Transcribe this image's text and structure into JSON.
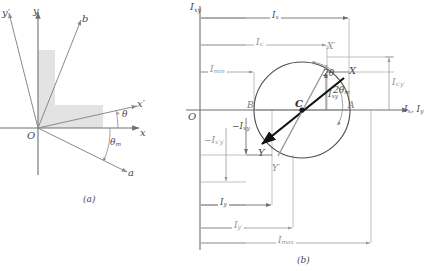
{
  "figure": {
    "panel_a": {
      "caption": "(a)",
      "axes": [
        {
          "name": "y-axis",
          "label": "y"
        },
        {
          "name": "x-axis",
          "label": "x"
        },
        {
          "name": "y-prime-axis",
          "label": "y′"
        },
        {
          "name": "x-prime-axis",
          "label": "x′"
        },
        {
          "name": "a-axis",
          "label": "a"
        },
        {
          "name": "b-axis",
          "label": "b"
        }
      ],
      "origin_label": "O",
      "angles": [
        {
          "name": "theta",
          "label": "θ"
        },
        {
          "name": "theta-m",
          "label": "θ",
          "sub": "m"
        }
      ],
      "shape": "L-shaped-section"
    },
    "panel_b": {
      "caption": "(b)",
      "origin_label": "O",
      "axis_vertical_label": "I",
      "axis_vertical_sub": "xy",
      "axis_horizontal_label": "I",
      "axis_horizontal_sub": "x",
      "axis_horizontal_label2": ", I",
      "axis_horizontal_sub2": "y",
      "points": [
        {
          "name": "point-X",
          "label": "X"
        },
        {
          "name": "point-X-prime",
          "label": "X′"
        },
        {
          "name": "point-Y",
          "label": "Y"
        },
        {
          "name": "point-Y-prime",
          "label": "Y′"
        },
        {
          "name": "point-A",
          "label": "A"
        },
        {
          "name": "point-B",
          "label": "B"
        },
        {
          "name": "point-C",
          "label": "C"
        }
      ],
      "angles": [
        {
          "name": "two-theta",
          "label": "2θ"
        },
        {
          "name": "two-theta-m",
          "label": "2θ",
          "sub": "m"
        }
      ],
      "dimensions": [
        {
          "name": "dim-Ix",
          "label": "I",
          "sub": "x"
        },
        {
          "name": "dim-Ix-prime",
          "label": "I",
          "sub": "x′"
        },
        {
          "name": "dim-Imin",
          "label": "I",
          "sub": "min"
        },
        {
          "name": "dim-Iy",
          "label": "I",
          "sub": "y"
        },
        {
          "name": "dim-Iy-prime",
          "label": "I",
          "sub": "y′"
        },
        {
          "name": "dim-Imax",
          "label": "I",
          "sub": "max"
        },
        {
          "name": "dim-Ixy",
          "label": "I",
          "sub": "xy"
        },
        {
          "name": "dim-Ixy-neg",
          "label": "−I",
          "sub": "xy"
        },
        {
          "name": "dim-Ixpyp",
          "label": "I",
          "sub": "x′y′"
        },
        {
          "name": "dim-Ixpyp-neg",
          "label": "−I",
          "sub": "x′y′"
        }
      ]
    }
  },
  "labels": {
    "a_caption": "(a)",
    "b_caption": "(b)",
    "y": "y",
    "x": "x",
    "yprime": "y′",
    "xprime": "x′",
    "a": "a",
    "b": "b",
    "O": "O",
    "theta": "θ",
    "theta_m_base": "θ",
    "theta_m_sub": "m",
    "two_theta": "2θ",
    "two_theta_m_base": "2θ",
    "two_theta_m_sub": "m",
    "X": "X",
    "Xp": "X′",
    "Y": "Y",
    "Yp": "Y′",
    "A": "A",
    "B": "B",
    "C": "C",
    "I": "I",
    "Ineg": "−I",
    "sub_x": "x",
    "sub_y": "y",
    "sub_xp": "x′",
    "sub_yp": "y′",
    "sub_xy": "xy",
    "sub_xpyp": "x′y′",
    "sub_min": "min",
    "sub_max": "max",
    "axis_h_x": "I",
    "axis_h_comma": ", I"
  },
  "colors": {
    "line": "#6f6f6f",
    "line_dark": "#3a3a3a",
    "accent_black": "#111111",
    "fill_shape": "#e2e2e2",
    "text": "#4a4a4a",
    "thin": "#9a9a9a"
  }
}
